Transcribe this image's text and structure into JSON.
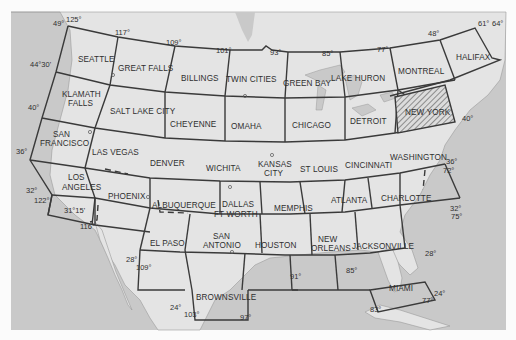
{
  "map": {
    "title": "Sectional Aeronautical Chart Index — Conterminous United States",
    "colors": {
      "water": "#c9c9c9",
      "land": "#e6e6e6",
      "grid_line": "#3a3a3a",
      "text": "#2f2f2f",
      "border": "#fbfbfb"
    },
    "charts": [
      {
        "id": "seattle",
        "label": "SEATTLE"
      },
      {
        "id": "great-falls",
        "label": "GREAT FALLS"
      },
      {
        "id": "billings",
        "label": "BILLINGS"
      },
      {
        "id": "twin-cities",
        "label": "TWIN CITIES"
      },
      {
        "id": "green-bay",
        "label": "GREEN BAY"
      },
      {
        "id": "lake-huron",
        "label": "LAKE HURON"
      },
      {
        "id": "montreal",
        "label": "MONTREAL"
      },
      {
        "id": "halifax",
        "label": "HALIFAX"
      },
      {
        "id": "klamath-falls",
        "label": "KLAMATH",
        "label2": "FALLS"
      },
      {
        "id": "salt-lake-city",
        "label": "SALT LAKE CITY"
      },
      {
        "id": "cheyenne",
        "label": "CHEYENNE"
      },
      {
        "id": "omaha",
        "label": "OMAHA"
      },
      {
        "id": "chicago",
        "label": "CHICAGO"
      },
      {
        "id": "detroit",
        "label": "DETROIT"
      },
      {
        "id": "new-york",
        "label": "NEW YORK",
        "highlighted": true
      },
      {
        "id": "san-francisco",
        "label": "SAN",
        "label2": "FRANCISCO"
      },
      {
        "id": "las-vegas",
        "label": "LAS VEGAS"
      },
      {
        "id": "denver",
        "label": "DENVER"
      },
      {
        "id": "wichita",
        "label": "WICHITA"
      },
      {
        "id": "kansas-city",
        "label": "KANSAS",
        "label2": "CITY"
      },
      {
        "id": "st-louis",
        "label": "ST LOUIS"
      },
      {
        "id": "cincinnati",
        "label": "CINCINNATI"
      },
      {
        "id": "washington",
        "label": "WASHINGTON"
      },
      {
        "id": "los-angeles",
        "label": "LOS",
        "label2": "ANGELES"
      },
      {
        "id": "phoenix",
        "label": "PHOENIX"
      },
      {
        "id": "albuquerque",
        "label": "ALBUQUERQUE"
      },
      {
        "id": "dallas-ft-worth",
        "label": "DALLAS",
        "label2": "FT WORTH"
      },
      {
        "id": "memphis",
        "label": "MEMPHIS"
      },
      {
        "id": "atlanta",
        "label": "ATLANTA"
      },
      {
        "id": "charlotte",
        "label": "CHARLOTTE"
      },
      {
        "id": "el-paso",
        "label": "EL PASO"
      },
      {
        "id": "san-antonio",
        "label": "SAN",
        "label2": "ANTONIO"
      },
      {
        "id": "houston",
        "label": "HOUSTON"
      },
      {
        "id": "new-orleans",
        "label": "NEW",
        "label2": "ORLEANS"
      },
      {
        "id": "jacksonville",
        "label": "JACKSONVILLE"
      },
      {
        "id": "brownsville",
        "label": "BROWNSVILLE"
      },
      {
        "id": "miami",
        "label": "MIAMI"
      }
    ],
    "degree_labels": {
      "lat49w": "49°",
      "lon125": "125°",
      "lon117": "117°",
      "lon109n": "109°",
      "lon101": "101°",
      "lon93": "93°",
      "lon85n": "85°",
      "lon77n": "77°",
      "lat48e": "48°",
      "lon61": "61°",
      "lon64": "64°",
      "lat4430": "44°30'",
      "lat40w": "40°",
      "lat40e": "40°",
      "lat36w": "36°",
      "lat36e": "36°",
      "lon72": "72°",
      "lat32w": "32°",
      "lon122": "122°",
      "lat3115": "31°15'",
      "lon116": "116°",
      "lat32e": "32°",
      "lon75": "75°",
      "lat28w": "28°",
      "lon109s": "109°",
      "lon91": "91°",
      "lon85s": "85°",
      "lat28e": "28°",
      "lat24": "24°",
      "lon103": "103°",
      "lon97": "97°",
      "lon77s": "77°",
      "lat24e": "24°",
      "lon83": "83°"
    }
  }
}
